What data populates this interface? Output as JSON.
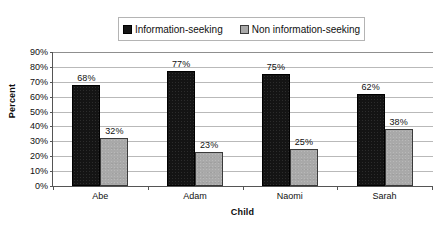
{
  "chart_data": {
    "type": "bar",
    "title": "",
    "xlabel": "Child",
    "ylabel": "Percent",
    "categories": [
      "Abe",
      "Adam",
      "Naomi",
      "Sarah"
    ],
    "series": [
      {
        "name": "Information-seeking",
        "color": "#141414",
        "swatch": "dark-square-icon",
        "values": [
          68,
          77,
          75,
          62
        ],
        "labels": [
          "68%",
          "77%",
          "75%",
          "62%"
        ]
      },
      {
        "name": "Non information-seeking",
        "color": "#a9a9a9",
        "swatch": "gray-square-icon",
        "values": [
          32,
          23,
          25,
          38
        ],
        "labels": [
          "32%",
          "23%",
          "25%",
          "38%"
        ]
      }
    ],
    "ylim": [
      0,
      90
    ],
    "ytick_labels": [
      "90%",
      "80%",
      "70%",
      "60%",
      "50%",
      "40%",
      "30%",
      "20%",
      "10%",
      "0%"
    ],
    "ytick_values": [
      90,
      80,
      70,
      60,
      50,
      40,
      30,
      20,
      10,
      0
    ],
    "grid": true,
    "grid_axis": "y",
    "legend_position": "top-center",
    "value_labels": true
  },
  "legend": {
    "entries": [
      {
        "label": "Information-seeking"
      },
      {
        "label": "Non information-seeking"
      }
    ]
  },
  "axes": {
    "y_title": "Percent",
    "x_title": "Child"
  }
}
